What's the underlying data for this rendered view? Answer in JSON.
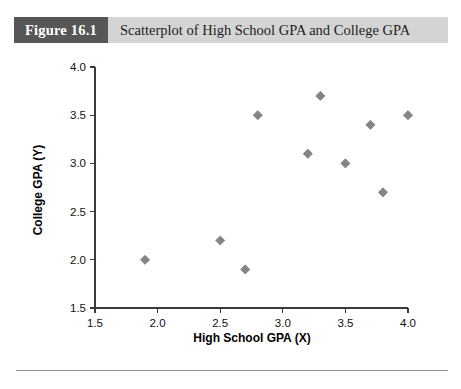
{
  "figure": {
    "number_label": "Figure 16.1",
    "title": "Scatterplot of High School GPA and College GPA"
  },
  "chart_data": {
    "type": "scatter",
    "title": "Scatterplot of High School GPA and College GPA",
    "xlabel": "High School GPA (X)",
    "ylabel": "College GPA (Y)",
    "xlim": [
      1.5,
      4.0
    ],
    "ylim": [
      1.5,
      4.0
    ],
    "xticks": [
      "1.5",
      "2.0",
      "2.5",
      "3.0",
      "3.5",
      "4.0"
    ],
    "yticks": [
      "1.5",
      "2.0",
      "2.5",
      "3.0",
      "3.5",
      "4.0"
    ],
    "grid": false,
    "legend": null,
    "marker": "diamond",
    "marker_color": "#858585",
    "points": [
      {
        "x": 1.9,
        "y": 2.0
      },
      {
        "x": 2.5,
        "y": 2.2
      },
      {
        "x": 2.7,
        "y": 1.9
      },
      {
        "x": 2.8,
        "y": 3.5
      },
      {
        "x": 3.2,
        "y": 3.1
      },
      {
        "x": 3.3,
        "y": 3.7
      },
      {
        "x": 3.5,
        "y": 3.0
      },
      {
        "x": 3.7,
        "y": 3.4
      },
      {
        "x": 3.8,
        "y": 2.7
      },
      {
        "x": 4.0,
        "y": 3.5
      }
    ]
  }
}
